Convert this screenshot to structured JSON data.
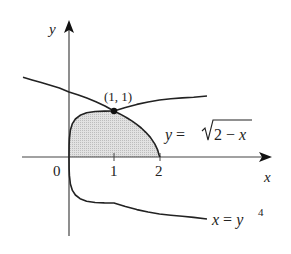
{
  "figure": {
    "axes": {
      "x_label": "x",
      "y_label": "y",
      "origin_label": "0",
      "x_ticks": [
        {
          "value": 1,
          "label": "1"
        },
        {
          "value": 2,
          "label": "2"
        }
      ]
    },
    "point": {
      "label": "(1, 1)",
      "x": 1,
      "y": 1
    },
    "curves": [
      {
        "name": "sqrt-curve",
        "equation_lhs": "y = ",
        "equation_radicand": "2 − x"
      },
      {
        "name": "quartic-curve",
        "equation_lhs": "x = y",
        "equation_exponent": "4"
      }
    ],
    "shaded_region": {
      "bounds": "x = y^4, y = sqrt(2 - x), y = 0",
      "fill": "#d9d9d9"
    },
    "colors": {
      "stroke": "#222222",
      "axis": "#444444",
      "fill": "#d6d6d6"
    }
  }
}
